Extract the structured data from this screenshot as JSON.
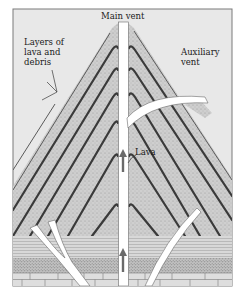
{
  "figure": {
    "type": "cross-section diagram"
  },
  "labels": {
    "main_vent": "Main vent",
    "layers": "Layers of\nlava and\ndebris",
    "auxiliary_vent": "Auxiliary\nvent",
    "lava": "Lava"
  },
  "colors": {
    "background": "#ffffff",
    "frame_fill": "#e6e6e6",
    "cone_fill": "#d2d2d2",
    "layer_stroke": "#3a3a3a",
    "vent_fill": "#ffffff",
    "arrow": "#6a6a6a",
    "bedrock_fill": "#dcdcdc"
  },
  "strata": [
    "layered lava and debris cone",
    "horizontal sedimentary layers",
    "speckled sandstone layer",
    "brick-patterned bedrock"
  ]
}
